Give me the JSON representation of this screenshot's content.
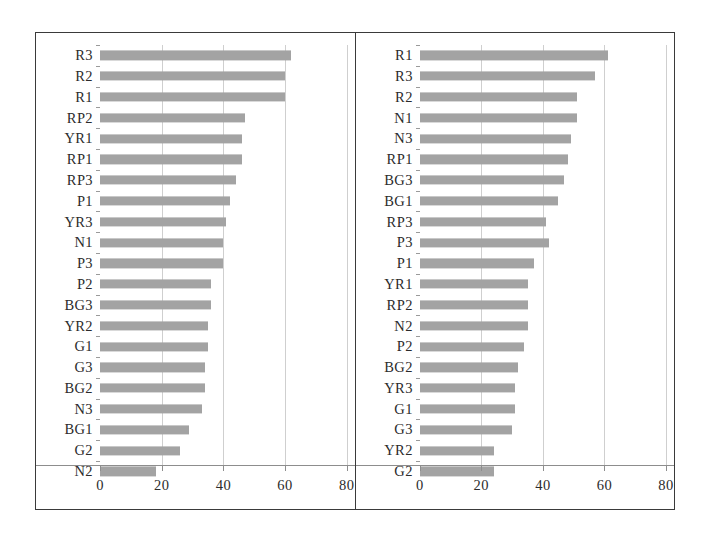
{
  "figure": {
    "background_color": "#ffffff",
    "frame_color": "#3a3a3a",
    "bar_color": "#a3a3a3",
    "gridline_color": "#cfcfcf",
    "axis_color": "#8d8d8d",
    "text_color": "#2b2b2b"
  },
  "chart_data": [
    {
      "type": "bar",
      "orientation": "horizontal",
      "panel": "left",
      "title": "",
      "subtitle": "",
      "xlabel": "",
      "ylabel": "",
      "xlim": [
        0,
        80
      ],
      "xticks": [
        0,
        20,
        40,
        60,
        80
      ],
      "xticklabels": [
        "0",
        "20",
        "40",
        "60",
        "80"
      ],
      "grid": true,
      "legend": false,
      "categories": [
        "R3",
        "R2",
        "R1",
        "RP2",
        "YR1",
        "RP1",
        "RP3",
        "P1",
        "YR3",
        "N1",
        "P3",
        "P2",
        "BG3",
        "YR2",
        "G1",
        "G3",
        "BG2",
        "N3",
        "BG1",
        "G2",
        "N2"
      ],
      "values": [
        62,
        60,
        60,
        47,
        46,
        46,
        44,
        42,
        41,
        40,
        40,
        36,
        36,
        35,
        35,
        34,
        34,
        33,
        29,
        26,
        18
      ]
    },
    {
      "type": "bar",
      "orientation": "horizontal",
      "panel": "right",
      "title": "",
      "subtitle": "",
      "xlabel": "",
      "ylabel": "",
      "xlim": [
        0,
        80
      ],
      "xticks": [
        0,
        20,
        40,
        60,
        80
      ],
      "xticklabels": [
        "0",
        "20",
        "40",
        "60",
        "80"
      ],
      "grid": true,
      "legend": false,
      "categories": [
        "R1",
        "R3",
        "R2",
        "N1",
        "N3",
        "RP1",
        "BG3",
        "BG1",
        "RP3",
        "P3",
        "P1",
        "YR1",
        "RP2",
        "N2",
        "P2",
        "BG2",
        "YR3",
        "G1",
        "G3",
        "YR2",
        "G2"
      ],
      "values": [
        61,
        57,
        51,
        51,
        49,
        48,
        47,
        45,
        41,
        42,
        37,
        35,
        35,
        35,
        34,
        32,
        31,
        31,
        30,
        24,
        24
      ]
    }
  ]
}
